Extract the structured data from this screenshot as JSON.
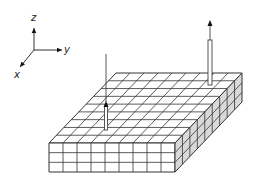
{
  "diagram": {
    "axes": {
      "origin": [
        34,
        50
      ],
      "z": {
        "label": "z",
        "tip": [
          34,
          28
        ],
        "label_pos": [
          31,
          21
        ]
      },
      "y": {
        "label": "y",
        "tip": [
          62,
          50
        ],
        "label_pos": [
          64,
          53
        ]
      },
      "x": {
        "label": "x",
        "tip": [
          20,
          67
        ],
        "label_pos": [
          14,
          78
        ]
      }
    },
    "slab": {
      "grid_cols": 9,
      "grid_rows_depth": 9,
      "layers": 3,
      "front_left_top": [
        49,
        143
      ],
      "front_right_top": [
        175,
        143
      ],
      "back_right_top": [
        242,
        73
      ],
      "back_left_top": [
        116,
        73
      ],
      "thickness": 29,
      "top_color": "#ffffff",
      "front_color": "#ffffff",
      "side_color": "#d9d9d9",
      "line_color": "#333333"
    },
    "arrows": [
      {
        "name": "left-arrow",
        "x": 106,
        "base_y": 130,
        "shaft_top_y": 106,
        "tip_y": 54,
        "type": "hollow-post-thin-line"
      },
      {
        "name": "right-arrow",
        "x": 210,
        "base_y": 85,
        "shaft_top_y": 40,
        "tip_y": 20,
        "type": "hollow-post-arrowhead"
      }
    ]
  }
}
